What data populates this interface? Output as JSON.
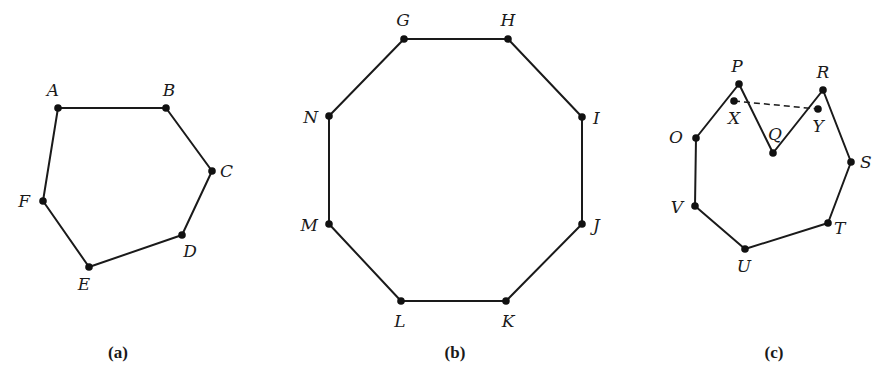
{
  "figures": [
    {
      "caption": "(a)",
      "caption_pos": [
        118,
        358
      ],
      "closed": true,
      "vertices": [
        {
          "label": "A",
          "x": 58,
          "y": 108,
          "lx": 53,
          "ly": 96,
          "anchor": "middle"
        },
        {
          "label": "B",
          "x": 166,
          "y": 108,
          "lx": 169,
          "ly": 96,
          "anchor": "middle"
        },
        {
          "label": "C",
          "x": 212,
          "y": 171,
          "lx": 220,
          "ly": 177,
          "anchor": "start"
        },
        {
          "label": "D",
          "x": 182,
          "y": 235,
          "lx": 190,
          "ly": 257,
          "anchor": "middle"
        },
        {
          "label": "E",
          "x": 89,
          "y": 267,
          "lx": 84,
          "ly": 290,
          "anchor": "middle"
        },
        {
          "label": "F",
          "x": 43,
          "y": 201,
          "lx": 30,
          "ly": 207,
          "anchor": "end"
        }
      ]
    },
    {
      "caption": "(b)",
      "caption_pos": [
        455,
        358
      ],
      "closed": true,
      "vertices": [
        {
          "label": "G",
          "x": 404,
          "y": 39,
          "lx": 403,
          "ly": 26,
          "anchor": "middle"
        },
        {
          "label": "H",
          "x": 508,
          "y": 39,
          "lx": 508,
          "ly": 26,
          "anchor": "middle"
        },
        {
          "label": "I",
          "x": 582,
          "y": 117,
          "lx": 593,
          "ly": 124,
          "anchor": "start"
        },
        {
          "label": "J",
          "x": 582,
          "y": 224,
          "lx": 593,
          "ly": 231,
          "anchor": "start"
        },
        {
          "label": "K",
          "x": 506,
          "y": 301,
          "lx": 508,
          "ly": 327,
          "anchor": "middle"
        },
        {
          "label": "L",
          "x": 401,
          "y": 301,
          "lx": 400,
          "ly": 327,
          "anchor": "middle"
        },
        {
          "label": "M",
          "x": 329,
          "y": 224,
          "lx": 318,
          "ly": 231,
          "anchor": "end"
        },
        {
          "label": "N",
          "x": 329,
          "y": 116,
          "lx": 318,
          "ly": 123,
          "anchor": "end"
        }
      ]
    },
    {
      "caption": "(c)",
      "caption_pos": [
        774,
        358
      ],
      "closed": true,
      "vertices": [
        {
          "label": "P",
          "x": 739,
          "y": 84,
          "lx": 737,
          "ly": 72,
          "anchor": "middle"
        },
        {
          "label": "Q",
          "x": 773,
          "y": 153,
          "lx": 775,
          "ly": 140,
          "anchor": "middle"
        },
        {
          "label": "R",
          "x": 823,
          "y": 90,
          "lx": 823,
          "ly": 78,
          "anchor": "middle"
        },
        {
          "label": "S",
          "x": 851,
          "y": 162,
          "lx": 860,
          "ly": 168,
          "anchor": "start"
        },
        {
          "label": "T",
          "x": 828,
          "y": 223,
          "lx": 834,
          "ly": 234,
          "anchor": "start"
        },
        {
          "label": "U",
          "x": 745,
          "y": 249,
          "lx": 744,
          "ly": 272,
          "anchor": "middle"
        },
        {
          "label": "V",
          "x": 695,
          "y": 206,
          "lx": 683,
          "ly": 213,
          "anchor": "end"
        },
        {
          "label": "O",
          "x": 696,
          "y": 138,
          "lx": 683,
          "ly": 143,
          "anchor": "end"
        }
      ],
      "interior_points": [
        {
          "label": "X",
          "x": 734,
          "y": 101,
          "lx": 734,
          "ly": 124,
          "anchor": "middle"
        },
        {
          "label": "Y",
          "x": 818,
          "y": 109,
          "lx": 818,
          "ly": 132,
          "anchor": "middle"
        }
      ],
      "dashed_segment": {
        "from": "X",
        "to": "Y"
      }
    }
  ]
}
